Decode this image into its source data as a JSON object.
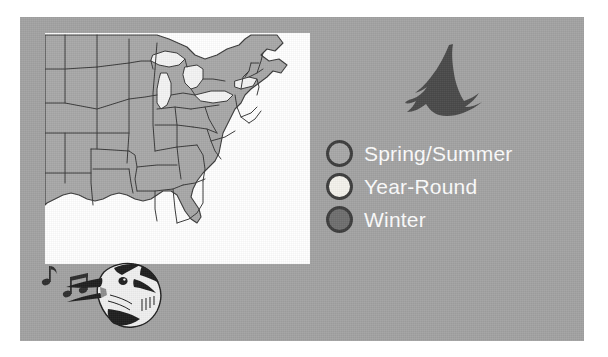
{
  "figure": {
    "name": "bird-range-map-figure",
    "panel_background": "#a3a3a3",
    "map_background": "#ffffff"
  },
  "map": {
    "name": "us-range-map",
    "region": "Eastern and Central United States",
    "land_fill": "#a8a8a8",
    "water_fill": "#ffffff",
    "lake_fill": "#f2f2f2",
    "border_color": "#3a3a3a"
  },
  "legend": {
    "title": "",
    "items": [
      {
        "label": "Spring/Summer",
        "color": "#a8a8a8",
        "ring": "#3d3d3d"
      },
      {
        "label": "Year-Round",
        "color": "#f4f2ec",
        "ring": "#3d3d3d"
      },
      {
        "label": "Winter",
        "color": "#6f6f6f",
        "ring": "#3d3d3d"
      }
    ]
  },
  "icons": {
    "flying_bird": "flying-bird-silhouette",
    "singing_bird": "singing-bird-head",
    "music_notes": "music-note-icon"
  }
}
